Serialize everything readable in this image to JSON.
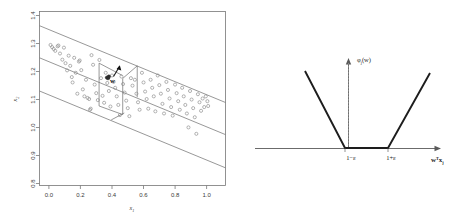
{
  "figure": {
    "background": "#ffffff",
    "panels": [
      "scatter-epsilon-tube",
      "epsilon-insensitive-loss"
    ]
  },
  "left_panel": {
    "axes": {
      "xlabel": "x",
      "xlabel_sub": "1",
      "ylabel": "x",
      "ylabel_sub": "2",
      "xticks": [
        "0.0",
        "0.2",
        "0.4",
        "0.6",
        "0.8",
        "1.0"
      ],
      "yticks": [
        "0.8",
        "0.9",
        "1.0",
        "1.1",
        "1.2",
        "1.3",
        "1.4"
      ],
      "xlim": [
        -0.06,
        1.12
      ],
      "ylim": [
        0.775,
        1.425
      ]
    },
    "annotation": {
      "w_label": "w"
    },
    "tube": {
      "center_label": "regression-hyperplane",
      "upper_label": "epsilon-upper-boundary",
      "lower_label": "epsilon-lower-boundary"
    }
  },
  "right_panel": {
    "ylabel": "φ",
    "ylabel_sub": "j",
    "ylabel_arg": "(w)",
    "xlabel": "w",
    "xlabel_sup": "T",
    "xlabel_x": "x",
    "xlabel_sub": "j",
    "tick_left": "1−ε",
    "tick_right": "1+ε",
    "curve_type": "epsilon-insensitive-loss"
  },
  "chart_data": [
    {
      "type": "scatter",
      "title": "",
      "xlabel": "x1",
      "ylabel": "x2",
      "xlim": [
        -0.06,
        1.12
      ],
      "ylim": [
        0.775,
        1.425
      ],
      "xticks": [
        0.0,
        0.2,
        0.4,
        0.6,
        0.8,
        1.0
      ],
      "yticks": [
        0.8,
        0.9,
        1.0,
        1.1,
        1.2,
        1.3,
        1.4
      ],
      "grid": false,
      "legend": null,
      "series": [
        {
          "name": "data-points",
          "marker": "open-circle",
          "x": [
            0.01,
            0.02,
            0.03,
            0.04,
            0.055,
            0.07,
            0.085,
            0.095,
            0.105,
            0.115,
            0.125,
            0.135,
            0.145,
            0.15,
            0.16,
            0.17,
            0.18,
            0.195,
            0.205,
            0.215,
            0.225,
            0.235,
            0.245,
            0.255,
            0.265,
            0.27,
            0.28,
            0.29,
            0.3,
            0.31,
            0.32,
            0.33,
            0.34,
            0.35,
            0.36,
            0.37,
            0.38,
            0.39,
            0.4,
            0.41,
            0.42,
            0.43,
            0.44,
            0.45,
            0.46,
            0.47,
            0.48,
            0.49,
            0.5,
            0.51,
            0.52,
            0.53,
            0.545,
            0.555,
            0.565,
            0.575,
            0.59,
            0.6,
            0.61,
            0.62,
            0.63,
            0.645,
            0.655,
            0.665,
            0.675,
            0.69,
            0.7,
            0.71,
            0.72,
            0.73,
            0.745,
            0.755,
            0.765,
            0.775,
            0.785,
            0.8,
            0.81,
            0.82,
            0.83,
            0.845,
            0.855,
            0.865,
            0.875,
            0.885,
            0.895,
            0.905,
            0.915,
            0.925,
            0.935,
            0.945,
            0.955,
            0.965,
            0.975,
            0.985,
            0.995,
            1.005,
            1.01,
            0.06,
            0.19,
            0.26
          ],
          "y": [
            1.3,
            1.292,
            1.285,
            1.278,
            1.295,
            1.268,
            1.245,
            1.29,
            1.232,
            1.205,
            1.26,
            1.222,
            1.18,
            1.16,
            1.252,
            1.196,
            1.118,
            1.242,
            1.206,
            1.134,
            1.108,
            1.17,
            1.102,
            1.098,
            1.062,
            1.262,
            1.226,
            1.152,
            1.12,
            1.094,
            1.244,
            1.176,
            1.11,
            1.084,
            1.196,
            1.158,
            1.128,
            1.07,
            1.186,
            1.162,
            1.14,
            1.108,
            1.076,
            1.038,
            1.182,
            1.154,
            1.122,
            1.092,
            1.064,
            1.034,
            1.176,
            1.148,
            1.17,
            1.118,
            1.086,
            1.058,
            1.196,
            1.16,
            1.126,
            1.098,
            1.062,
            1.17,
            1.14,
            1.108,
            1.052,
            1.186,
            1.15,
            1.118,
            1.08,
            1.044,
            1.162,
            1.132,
            1.1,
            1.068,
            1.036,
            1.152,
            1.12,
            1.09,
            1.058,
            1.14,
            1.108,
            1.076,
            1.044,
            0.992,
            1.128,
            1.096,
            1.064,
            1.03,
            0.968,
            1.116,
            1.086,
            1.054,
            1.1,
            1.068,
            1.108,
            1.09,
            1.072,
            1.298,
            1.238,
            1.058
          ],
          "dark_points": {
            "x": [
              0.368,
              0.375,
              0.38
            ],
            "y": [
              1.178,
              1.176,
              1.182
            ]
          }
        }
      ],
      "lines": [
        {
          "name": "regression-hyperplane",
          "x": [
            -0.06,
            1.12
          ],
          "y": [
            1.252,
            0.965
          ],
          "style": "solid"
        },
        {
          "name": "epsilon-upper-boundary",
          "x": [
            -0.06,
            1.12
          ],
          "y": [
            1.372,
            1.085
          ],
          "style": "solid"
        },
        {
          "name": "epsilon-lower-boundary",
          "x": [
            -0.06,
            1.12
          ],
          "y": [
            1.128,
            0.841
          ],
          "style": "solid"
        }
      ],
      "annotations": [
        {
          "type": "arrow-label",
          "text": "w",
          "x": 0.385,
          "y": 1.185
        }
      ]
    },
    {
      "type": "line",
      "title": "",
      "xlabel": "w^T x_j",
      "ylabel": "phi_j(w)",
      "grid": false,
      "legend": null,
      "xticks_labels": [
        "1−ε",
        "1+ε"
      ],
      "series": [
        {
          "name": "epsilon-insensitive-loss",
          "x": [
            -1.9,
            -0.25,
            0.28,
            1.95
          ],
          "y": [
            1.62,
            0.0,
            0.0,
            1.55
          ],
          "style": "solid"
        }
      ],
      "axis_lines": [
        {
          "name": "x-axis",
          "from": [
            -2.55,
            0
          ],
          "to": [
            2.45,
            0
          ],
          "arrow": true
        },
        {
          "name": "y-axis",
          "from": [
            -0.05,
            0
          ],
          "to": [
            -0.05,
            1.82
          ],
          "arrow": true
        }
      ]
    }
  ]
}
